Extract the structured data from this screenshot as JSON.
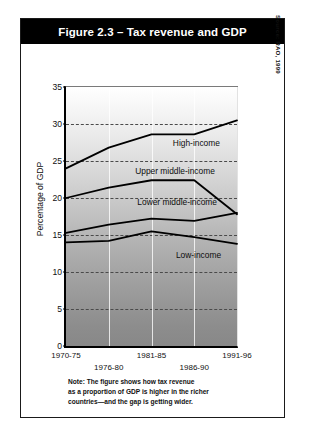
{
  "figure": {
    "title": "Figure 2.3 – Tax revenue and GDP",
    "source": "Source: RAO, 1999",
    "note_lines": [
      "Note: The figure shows how tax revenue",
      "as a proportion of GDP is higher in the richer",
      "countries—and the gap is getting wider."
    ]
  },
  "chart_data": {
    "type": "line",
    "title": "Figure 2.3 – Tax revenue and GDP",
    "xlabel": "",
    "ylabel": "Percentage of GDP",
    "categories": [
      "1970-75",
      "1976-80",
      "1981-85",
      "1986-90",
      "1991-96"
    ],
    "ylim": [
      0,
      35
    ],
    "yticks": [
      0,
      5,
      10,
      15,
      20,
      25,
      30,
      35
    ],
    "ytick_labels": [
      "0",
      "5",
      "10",
      "15",
      "20",
      "25",
      "30",
      "35"
    ],
    "grid": true,
    "legend": "inline-labels",
    "series": [
      {
        "name": "High-income",
        "values": [
          24.0,
          26.8,
          28.6,
          28.6,
          30.5
        ]
      },
      {
        "name": "Upper middle-income",
        "values": [
          20.0,
          21.4,
          22.4,
          22.4,
          17.8
        ]
      },
      {
        "name": "Lower middle-income",
        "values": [
          15.3,
          16.4,
          17.2,
          16.9,
          18.0
        ]
      },
      {
        "name": "Low-income",
        "values": [
          14.0,
          14.2,
          15.5,
          14.7,
          13.8
        ]
      }
    ],
    "annotations": [
      {
        "text": "High-income",
        "x": 3.05,
        "y": 27.4
      },
      {
        "text": "Upper middle-income",
        "x": 2.55,
        "y": 23.6
      },
      {
        "text": "Lower middle-income",
        "x": 2.6,
        "y": 19.5
      },
      {
        "text": "Low-income",
        "x": 3.1,
        "y": 12.3
      }
    ]
  },
  "colors": {
    "title_bar": "#000000",
    "title_text": "#ffffff",
    "line": "#000000",
    "grid": "#4a4a4a"
  }
}
